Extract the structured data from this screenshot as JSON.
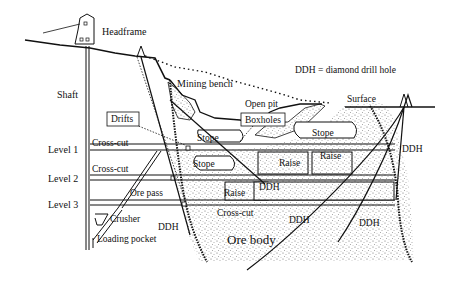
{
  "diagram": {
    "type": "mine cross-section",
    "legend": "DDH = diamond drill hole",
    "labels": {
      "headframe": "Headframe",
      "shaft": "Shaft",
      "mining_bench": "Mining bench",
      "open_pit": "Open pit",
      "surface": "Surface",
      "drifts": "Drifts",
      "boxholes": "Boxholes",
      "stope_1": "Stope",
      "stope_2": "Stope",
      "stope_3": "Stope",
      "raise_1": "Raise",
      "raise_2": "Raise",
      "raise_3": "Raise",
      "cross_cut_1": "Cross-cut",
      "cross_cut_2": "Cross-cut",
      "cross_cut_3": "Cross-cut",
      "level_1": "Level 1",
      "level_2": "Level 2",
      "level_3": "Level 3",
      "ore_pass": "Ore pass",
      "crusher": "Crusher",
      "loading_pocket": "Loading pocket",
      "ore_body": "Ore body",
      "ddh_1": "DDH",
      "ddh_2": "DDH",
      "ddh_3": "DDH",
      "ddh_4": "DDH",
      "ddh_5": "DDH"
    },
    "colors": {
      "ink": "#111111",
      "background": "#ffffff",
      "ore_stipple": "#555555"
    }
  }
}
